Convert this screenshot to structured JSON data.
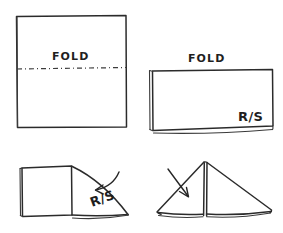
{
  "document": {
    "title": "Fabric Folding Instruction Diagram",
    "style": "hand-drawn ink sketch",
    "background_color": "#ffffff",
    "ink_color": "#2b2b2b",
    "width": 283,
    "height": 233
  },
  "panels": [
    {
      "id": "panel-1",
      "position": "top-left",
      "step": 1,
      "shape": "square",
      "description": "Flat square of fabric with a horizontal dash-dot fold line across the middle",
      "labels": [
        {
          "name": "fold-label",
          "text": "FOLD",
          "x": 72,
          "y": 62
        }
      ],
      "fold_line": {
        "type": "dash-dot",
        "orientation": "horizontal",
        "y": 68
      },
      "arrows": []
    },
    {
      "id": "panel-2",
      "position": "top-right",
      "step": 2,
      "shape": "rectangle",
      "description": "Fabric folded in half into a rectangle, fold at left edge, right side facing up",
      "labels": [
        {
          "name": "fold-label",
          "text": "FOLD",
          "x": 204,
          "y": 62
        },
        {
          "name": "right-side-label",
          "text": "R/S",
          "x": 250,
          "y": 120
        }
      ],
      "fold_line": {
        "type": "edge",
        "orientation": "vertical",
        "x": 150
      },
      "arrows": []
    },
    {
      "id": "panel-3",
      "position": "bottom-left",
      "step": 3,
      "shape": "square-with-triangular-flap",
      "description": "Corner folded down diagonally forming a triangular flap; curved arrow shows the fold direction",
      "labels": [
        {
          "name": "right-side-label",
          "text": "R/S",
          "x": 102,
          "y": 206
        }
      ],
      "arrows": [
        {
          "name": "fold-direction-arrow",
          "direction": "down-left",
          "curved": true
        }
      ]
    },
    {
      "id": "panel-4",
      "position": "bottom-right",
      "step": 4,
      "shape": "triangle-tent",
      "description": "Completed triangle standing like a tent with a vertical center fold spine; curved arrow indicates folding inward",
      "labels": [],
      "arrows": [
        {
          "name": "fold-direction-arrow",
          "direction": "down-right",
          "curved": true
        }
      ]
    }
  ],
  "legend": {
    "fold_text": "FOLD",
    "right_side_text": "R/S",
    "right_side_meaning": "R/S"
  }
}
